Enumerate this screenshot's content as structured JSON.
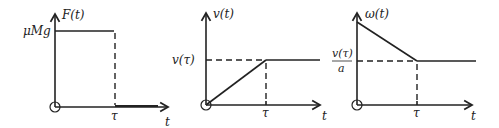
{
  "panels": [
    {
      "id": "force",
      "y_label": "F(t)",
      "x_label": "t",
      "y_level_label": "μMg",
      "x_mark_label": "τ",
      "description": "Constant force μMg from 0 to τ, then zero"
    },
    {
      "id": "velocity",
      "y_label": "v(t)",
      "x_label": "t",
      "y_level_label": "v(τ)",
      "x_mark_label": "τ",
      "description": "Velocity rises linearly from 0 to v(τ) at τ, then constant"
    },
    {
      "id": "angular-velocity",
      "y_label": "ω(t)",
      "x_label": "t",
      "y_level_label_num": "v(τ)",
      "y_level_label_den": "a",
      "x_mark_label": "τ",
      "description": "Angular velocity decreases linearly to v(τ)/a at τ, then constant"
    }
  ],
  "colors": {
    "ink": "#222222",
    "background": "#ffffff"
  }
}
